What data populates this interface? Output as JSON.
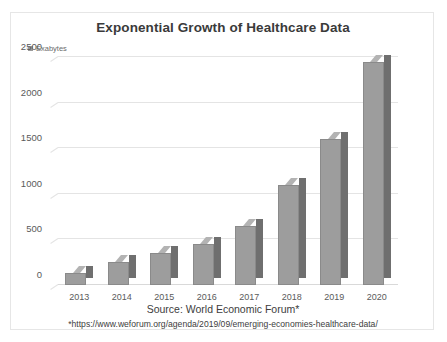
{
  "clipped_top_text": "                                                                        ",
  "chart": {
    "title": "Exponential Growth of Healthcare Data",
    "legend": {
      "label": "Exabytes",
      "swatch_color": "#9b9b9b"
    },
    "source_line": "Source: World Economic Forum*",
    "source_url": "*https://www.weforum.org/agenda/2019/09/emerging-economies-healthcare-data/"
  },
  "chart_data": {
    "type": "bar",
    "title": "Exponential Growth of Healthcare Data",
    "xlabel": "",
    "ylabel": "Exabytes",
    "categories": [
      "2013",
      "2014",
      "2015",
      "2016",
      "2017",
      "2018",
      "2019",
      "2020"
    ],
    "values": [
      130,
      250,
      350,
      450,
      650,
      1100,
      1600,
      2450
    ],
    "series": [
      {
        "name": "Exabytes",
        "values": [
          130,
          250,
          350,
          450,
          650,
          1100,
          1600,
          2450
        ]
      }
    ],
    "ylim": [
      0,
      2500
    ],
    "ytick_labels": [
      "0",
      "500",
      "1000",
      "1500",
      "2000",
      "2500"
    ],
    "ytick_values": [
      0,
      500,
      1000,
      1500,
      2000,
      2500
    ],
    "grid": true,
    "legend_position": "top-left",
    "bar_style": "3d-column",
    "bar_front_color": "#9d9d9d",
    "bar_side_color": "#6f6f6f",
    "bar_top_color": "#b3b3b3",
    "gridline_color": "#e4e4e4",
    "annotations": [
      "Source: World Economic Forum*",
      "*https://www.weforum.org/agenda/2019/09/emerging-economies-healthcare-data/"
    ]
  }
}
